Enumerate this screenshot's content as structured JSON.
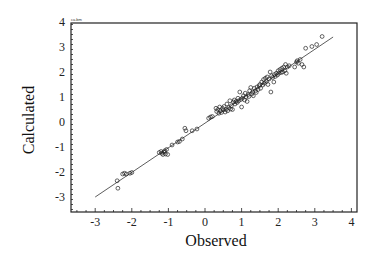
{
  "chart_data": {
    "type": "scatter",
    "title": "",
    "corner_note": "ca.bm",
    "xlabel": "Observed",
    "ylabel": "Calculated",
    "xlim": [
      -3.6,
      4.2
    ],
    "ylim": [
      -3.7,
      4.1
    ],
    "xticks": [
      -3,
      -2,
      -1,
      0,
      1,
      2,
      3,
      4
    ],
    "yticks": [
      -3,
      -2,
      -1,
      0,
      1,
      2,
      3,
      4
    ],
    "grid": false,
    "legend": null,
    "marker": "open-circle",
    "fit_line": {
      "x": [
        -3.0,
        3.5
      ],
      "y": [
        -3.0,
        3.4
      ]
    },
    "series": [
      {
        "name": "compounds",
        "points": [
          [
            -2.4,
            -2.35
          ],
          [
            -2.38,
            -2.65
          ],
          [
            -2.25,
            -2.08
          ],
          [
            -2.2,
            -2.05
          ],
          [
            -2.15,
            -2.08
          ],
          [
            -2.05,
            -2.05
          ],
          [
            -2.0,
            -2.02
          ],
          [
            -1.25,
            -1.22
          ],
          [
            -1.2,
            -1.18
          ],
          [
            -1.18,
            -1.25
          ],
          [
            -1.15,
            -1.3
          ],
          [
            -1.12,
            -1.2
          ],
          [
            -1.1,
            -1.15
          ],
          [
            -1.08,
            -1.28
          ],
          [
            -1.05,
            -1.1
          ],
          [
            -1.02,
            -1.3
          ],
          [
            -0.9,
            -0.92
          ],
          [
            -0.75,
            -0.8
          ],
          [
            -0.7,
            -0.78
          ],
          [
            -0.62,
            -0.68
          ],
          [
            -0.55,
            -0.25
          ],
          [
            -0.52,
            -0.35
          ],
          [
            -0.35,
            -0.35
          ],
          [
            -0.22,
            -0.28
          ],
          [
            0.1,
            0.15
          ],
          [
            0.15,
            0.2
          ],
          [
            0.2,
            0.22
          ],
          [
            0.3,
            0.55
          ],
          [
            0.32,
            0.42
          ],
          [
            0.35,
            0.5
          ],
          [
            0.38,
            0.35
          ],
          [
            0.4,
            0.6
          ],
          [
            0.42,
            0.45
          ],
          [
            0.45,
            0.38
          ],
          [
            0.48,
            0.55
          ],
          [
            0.5,
            0.48
          ],
          [
            0.52,
            0.62
          ],
          [
            0.55,
            0.4
          ],
          [
            0.58,
            0.5
          ],
          [
            0.6,
            0.72
          ],
          [
            0.62,
            0.45
          ],
          [
            0.65,
            0.58
          ],
          [
            0.68,
            0.85
          ],
          [
            0.7,
            0.52
          ],
          [
            0.72,
            0.65
          ],
          [
            0.75,
            0.5
          ],
          [
            0.78,
            0.8
          ],
          [
            0.8,
            0.88
          ],
          [
            0.82,
            0.72
          ],
          [
            0.85,
            0.82
          ],
          [
            0.88,
            0.78
          ],
          [
            0.9,
            0.95
          ],
          [
            0.92,
            0.85
          ],
          [
            0.95,
            1.2
          ],
          [
            0.98,
            0.9
          ],
          [
            1.0,
            0.6
          ],
          [
            1.02,
            0.95
          ],
          [
            1.05,
            1.05
          ],
          [
            1.08,
            0.88
          ],
          [
            1.1,
            1.15
          ],
          [
            1.12,
            1.0
          ],
          [
            1.15,
            0.82
          ],
          [
            1.18,
            1.1
          ],
          [
            1.2,
            1.02
          ],
          [
            1.22,
            1.25
          ],
          [
            1.25,
            1.38
          ],
          [
            1.28,
            1.12
          ],
          [
            1.3,
            1.2
          ],
          [
            1.32,
            1.05
          ],
          [
            1.35,
            1.35
          ],
          [
            1.38,
            1.25
          ],
          [
            1.4,
            1.18
          ],
          [
            1.42,
            1.4
          ],
          [
            1.45,
            1.3
          ],
          [
            1.48,
            1.45
          ],
          [
            1.5,
            1.5
          ],
          [
            1.52,
            1.35
          ],
          [
            1.55,
            1.6
          ],
          [
            1.58,
            1.48
          ],
          [
            1.6,
            1.7
          ],
          [
            1.62,
            1.55
          ],
          [
            1.65,
            1.75
          ],
          [
            1.68,
            1.62
          ],
          [
            1.7,
            1.8
          ],
          [
            1.72,
            1.5
          ],
          [
            1.75,
            1.72
          ],
          [
            1.78,
            2.0
          ],
          [
            1.8,
            1.2
          ],
          [
            1.82,
            1.85
          ],
          [
            1.85,
            1.78
          ],
          [
            1.88,
            1.6
          ],
          [
            1.9,
            1.9
          ],
          [
            1.92,
            1.82
          ],
          [
            1.95,
            1.95
          ],
          [
            1.98,
            1.88
          ],
          [
            2.0,
            2.05
          ],
          [
            2.02,
            1.95
          ],
          [
            2.05,
            2.1
          ],
          [
            2.08,
            1.98
          ],
          [
            2.1,
            2.15
          ],
          [
            2.12,
            2.0
          ],
          [
            2.15,
            2.2
          ],
          [
            2.18,
            2.05
          ],
          [
            2.2,
            2.3
          ],
          [
            2.22,
            1.95
          ],
          [
            2.25,
            2.2
          ],
          [
            2.3,
            2.25
          ],
          [
            2.45,
            2.2
          ],
          [
            2.5,
            2.4
          ],
          [
            2.52,
            2.45
          ],
          [
            2.55,
            2.35
          ],
          [
            2.6,
            2.5
          ],
          [
            2.65,
            2.3
          ],
          [
            2.7,
            2.2
          ],
          [
            2.75,
            2.95
          ],
          [
            2.92,
            3.02
          ],
          [
            3.05,
            3.1
          ],
          [
            3.2,
            3.42
          ]
        ]
      }
    ]
  }
}
